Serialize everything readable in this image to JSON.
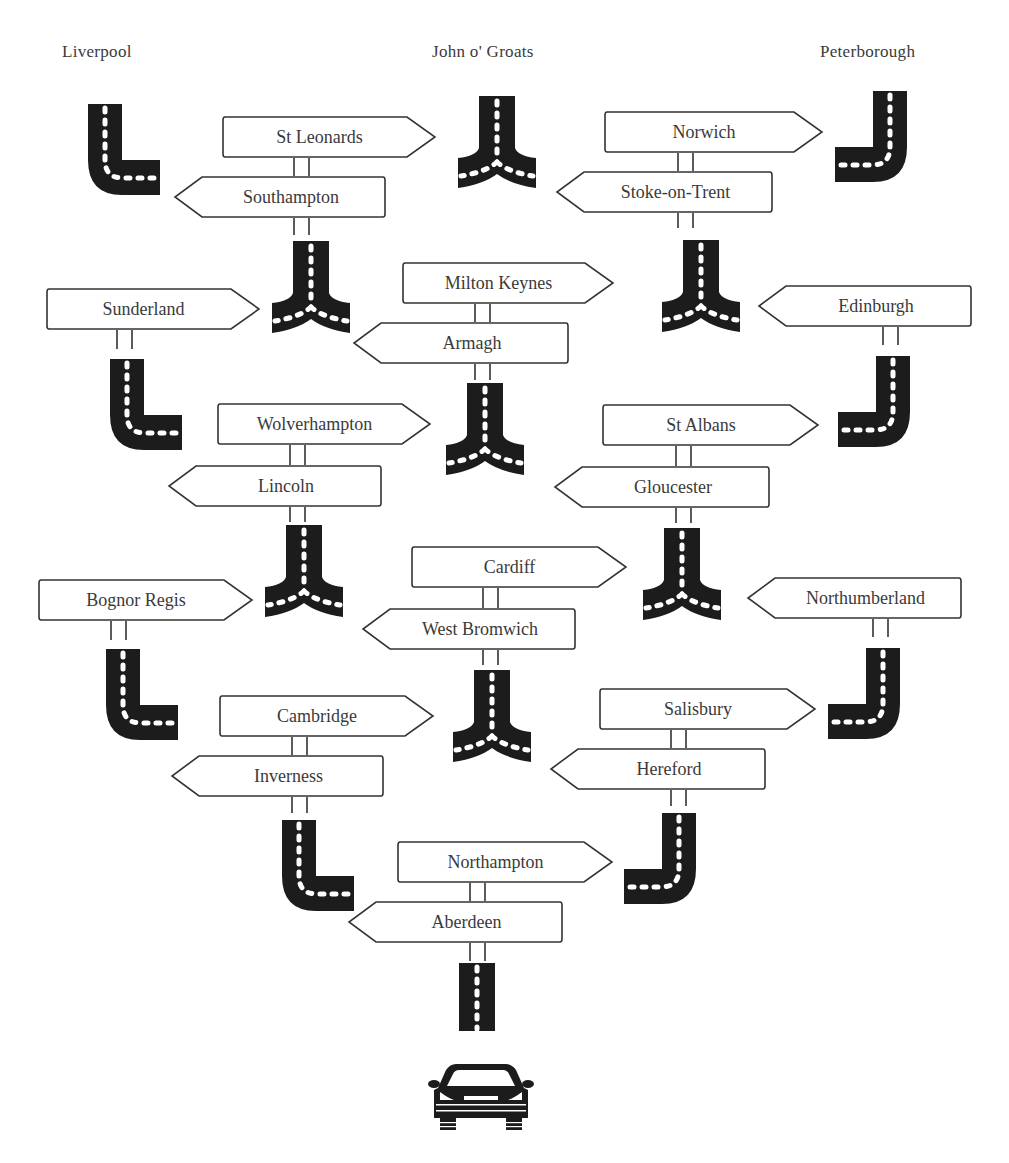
{
  "destinations": [
    {
      "label": "Liverpool",
      "x": 62,
      "y": 42
    },
    {
      "label": "John o' Groats",
      "x": 432,
      "y": 42
    },
    {
      "label": "Peterborough",
      "x": 820,
      "y": 42
    }
  ],
  "signs": [
    {
      "id": "st-leonards",
      "label": "St Leonards",
      "dir": "right",
      "x": 222,
      "y": 116,
      "w": 213,
      "h": 42
    },
    {
      "id": "southampton",
      "label": "Southampton",
      "dir": "left",
      "x": 174,
      "y": 176,
      "w": 212,
      "h": 42
    },
    {
      "id": "norwich",
      "label": "Norwich",
      "dir": "right",
      "x": 604,
      "y": 111,
      "w": 218,
      "h": 42
    },
    {
      "id": "stoke-on-trent",
      "label": "Stoke-on-Trent",
      "dir": "left",
      "x": 556,
      "y": 171,
      "w": 217,
      "h": 42
    },
    {
      "id": "sunderland",
      "label": "Sunderland",
      "dir": "right",
      "x": 46,
      "y": 288,
      "w": 213,
      "h": 42
    },
    {
      "id": "milton-keynes",
      "label": "Milton Keynes",
      "dir": "right",
      "x": 402,
      "y": 262,
      "w": 211,
      "h": 42
    },
    {
      "id": "armagh",
      "label": "Armagh",
      "dir": "left",
      "x": 353,
      "y": 322,
      "w": 216,
      "h": 42
    },
    {
      "id": "edinburgh",
      "label": "Edinburgh",
      "dir": "left",
      "x": 758,
      "y": 285,
      "w": 214,
      "h": 42
    },
    {
      "id": "wolverhampton",
      "label": "Wolverhampton",
      "dir": "right",
      "x": 217,
      "y": 403,
      "w": 213,
      "h": 42
    },
    {
      "id": "lincoln",
      "label": "Lincoln",
      "dir": "left",
      "x": 168,
      "y": 465,
      "w": 214,
      "h": 42
    },
    {
      "id": "st-albans",
      "label": "St Albans",
      "dir": "right",
      "x": 602,
      "y": 404,
      "w": 216,
      "h": 42
    },
    {
      "id": "gloucester",
      "label": "Gloucester",
      "dir": "left",
      "x": 554,
      "y": 466,
      "w": 216,
      "h": 42
    },
    {
      "id": "bognor-regis",
      "label": "Bognor Regis",
      "dir": "right",
      "x": 38,
      "y": 579,
      "w": 214,
      "h": 42
    },
    {
      "id": "cardiff",
      "label": "Cardiff",
      "dir": "right",
      "x": 411,
      "y": 546,
      "w": 215,
      "h": 42
    },
    {
      "id": "west-bromwich",
      "label": "West Bromwich",
      "dir": "left",
      "x": 362,
      "y": 608,
      "w": 214,
      "h": 42
    },
    {
      "id": "northumberland",
      "label": "Northumberland",
      "dir": "left",
      "x": 747,
      "y": 577,
      "w": 215,
      "h": 42
    },
    {
      "id": "cambridge",
      "label": "Cambridge",
      "dir": "right",
      "x": 219,
      "y": 695,
      "w": 214,
      "h": 42
    },
    {
      "id": "inverness",
      "label": "Inverness",
      "dir": "left",
      "x": 171,
      "y": 755,
      "w": 213,
      "h": 42
    },
    {
      "id": "salisbury",
      "label": "Salisbury",
      "dir": "right",
      "x": 599,
      "y": 688,
      "w": 216,
      "h": 42
    },
    {
      "id": "hereford",
      "label": "Hereford",
      "dir": "left",
      "x": 550,
      "y": 748,
      "w": 216,
      "h": 42
    },
    {
      "id": "northampton",
      "label": "Northampton",
      "dir": "right",
      "x": 397,
      "y": 841,
      "w": 215,
      "h": 42
    },
    {
      "id": "aberdeen",
      "label": "Aberdeen",
      "dir": "left",
      "x": 348,
      "y": 901,
      "w": 215,
      "h": 42
    }
  ],
  "posts": [
    {
      "x": 293,
      "y": 158,
      "h": 18
    },
    {
      "x": 293,
      "y": 218,
      "h": 17
    },
    {
      "x": 677,
      "y": 153,
      "h": 18
    },
    {
      "x": 677,
      "y": 213,
      "h": 15
    },
    {
      "x": 116,
      "y": 330,
      "h": 19
    },
    {
      "x": 474,
      "y": 304,
      "h": 18
    },
    {
      "x": 474,
      "y": 364,
      "h": 16
    },
    {
      "x": 882,
      "y": 327,
      "h": 18
    },
    {
      "x": 289,
      "y": 445,
      "h": 20
    },
    {
      "x": 289,
      "y": 507,
      "h": 15
    },
    {
      "x": 675,
      "y": 446,
      "h": 20
    },
    {
      "x": 675,
      "y": 508,
      "h": 15
    },
    {
      "x": 110,
      "y": 621,
      "h": 19
    },
    {
      "x": 482,
      "y": 588,
      "h": 20
    },
    {
      "x": 482,
      "y": 650,
      "h": 15
    },
    {
      "x": 872,
      "y": 619,
      "h": 18
    },
    {
      "x": 291,
      "y": 737,
      "h": 18
    },
    {
      "x": 291,
      "y": 797,
      "h": 16
    },
    {
      "x": 670,
      "y": 730,
      "h": 18
    },
    {
      "x": 670,
      "y": 790,
      "h": 16
    },
    {
      "x": 469,
      "y": 883,
      "h": 18
    },
    {
      "x": 469,
      "y": 943,
      "h": 18
    }
  ],
  "roads": [
    {
      "type": "turn-left-to-right",
      "x": 88,
      "y": 104
    },
    {
      "type": "fork",
      "x": 458,
      "y": 96
    },
    {
      "type": "turn-right-to-left",
      "x": 835,
      "y": 91
    },
    {
      "type": "fork",
      "x": 272,
      "y": 241
    },
    {
      "type": "fork",
      "x": 662,
      "y": 240
    },
    {
      "type": "turn-left-to-right",
      "x": 110,
      "y": 359
    },
    {
      "type": "fork",
      "x": 446,
      "y": 383
    },
    {
      "type": "turn-right-to-left",
      "x": 838,
      "y": 356
    },
    {
      "type": "fork",
      "x": 265,
      "y": 525
    },
    {
      "type": "fork",
      "x": 643,
      "y": 528
    },
    {
      "type": "turn-left-to-right",
      "x": 106,
      "y": 649
    },
    {
      "type": "fork",
      "x": 453,
      "y": 670
    },
    {
      "type": "turn-right-to-left",
      "x": 828,
      "y": 648
    },
    {
      "type": "turn-left-to-right",
      "x": 282,
      "y": 820
    },
    {
      "type": "turn-right-to-left",
      "x": 624,
      "y": 813
    },
    {
      "type": "straight",
      "x": 459,
      "y": 963
    }
  ],
  "vehicle": {
    "icon": "car-icon",
    "x": 428,
    "y": 1062
  }
}
